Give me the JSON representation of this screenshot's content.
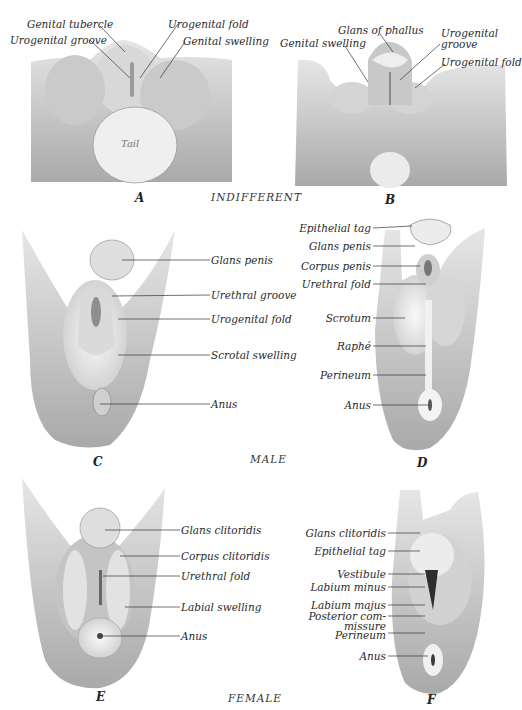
{
  "figure": {
    "sections": {
      "indifferent": "INDIFFERENT",
      "male": "MALE",
      "female": "FEMALE"
    },
    "panels": {
      "A": {
        "letter": "A",
        "labels": [
          "Genital tubercle",
          "Urogenital groove",
          "Urogenital fold",
          "Genital swelling"
        ],
        "inner_label": "Tail"
      },
      "B": {
        "letter": "B",
        "labels": [
          "Glans of phallus",
          "Genital swelling",
          "Urogenital",
          "groove",
          "Urogenital fold"
        ]
      },
      "C": {
        "letter": "C",
        "labels": [
          "Glans penis",
          "Urethral groove",
          "Urogenital fold",
          "Scrotal swelling",
          "Anus"
        ]
      },
      "D": {
        "letter": "D",
        "labels": [
          "Epithelial tag",
          "Glans penis",
          "Corpus penis",
          "Urethral fold",
          "Scrotum",
          "Raphé",
          "Perineum",
          "Anus"
        ]
      },
      "E": {
        "letter": "E",
        "labels": [
          "Glans clitoridis",
          "Corpus clitoridis",
          "Urethral fold",
          "Labial swelling",
          "Anus"
        ]
      },
      "F": {
        "letter": "F",
        "labels": [
          "Glans clitoridis",
          "Epithelial tag",
          "Vestibule",
          "Labium minus",
          "Labium majus",
          "Posterior com-",
          "missure",
          "Perineum",
          "Anus"
        ]
      }
    }
  }
}
